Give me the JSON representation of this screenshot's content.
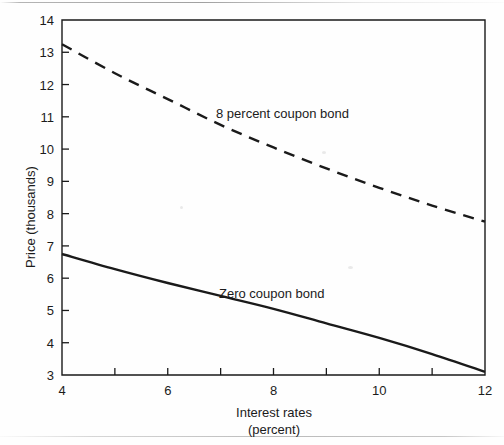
{
  "figure": {
    "background_color": "#fefefe",
    "ink_color": "#1a1a1a"
  },
  "chart_data": {
    "type": "line",
    "title": "",
    "subtitle": "",
    "xlabel": "Interest rates",
    "xlabel_sub": "(percent)",
    "ylabel": "Price (thousands)",
    "xlim": [
      4,
      12
    ],
    "ylim": [
      3,
      14
    ],
    "grid": false,
    "legend_position": "inline-annotation",
    "x_ticks": [
      4,
      5,
      6,
      7,
      8,
      9,
      10,
      11,
      12
    ],
    "x_tick_labels": [
      "4",
      "",
      "6",
      "",
      "8",
      "",
      "10",
      "",
      "12"
    ],
    "y_ticks": [
      3,
      4,
      5,
      6,
      7,
      8,
      9,
      10,
      11,
      12,
      13,
      14
    ],
    "y_tick_labels": [
      "3",
      "4",
      "5",
      "6",
      "7",
      "8",
      "9",
      "10",
      "11",
      "12",
      "13",
      "14"
    ],
    "x": [
      4,
      5,
      6,
      7,
      8,
      9,
      10,
      11,
      12
    ],
    "series": [
      {
        "name": "8 percent coupon bond",
        "style": "dashed",
        "color": "#1a1a1a",
        "values": [
          13.25,
          12.35,
          11.55,
          10.75,
          10.05,
          9.4,
          8.8,
          8.25,
          7.75
        ]
      },
      {
        "name": "Zero coupon bond",
        "style": "solid",
        "color": "#1a1a1a",
        "values": [
          6.75,
          6.28,
          5.85,
          5.45,
          5.05,
          4.6,
          4.15,
          3.65,
          3.1
        ]
      }
    ],
    "annotations": [
      {
        "text": "8 percent coupon bond",
        "x": 8.1,
        "y": 11.1
      },
      {
        "text": "Zero coupon bond",
        "x": 7.9,
        "y": 5.55
      }
    ]
  }
}
